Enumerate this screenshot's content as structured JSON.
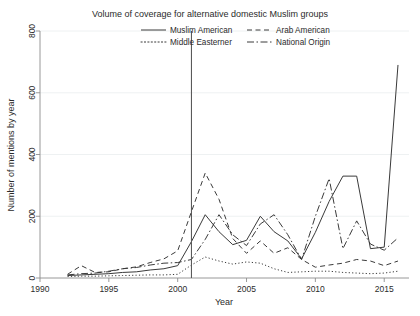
{
  "chart_data": {
    "type": "line",
    "title": "Volume of coverage for alternative domestic Muslim groups",
    "xlabel": "Year",
    "ylabel": "Number of mentions by year",
    "xlim": [
      1990,
      2016.8
    ],
    "ylim": [
      0,
      800
    ],
    "grid": "horizontal",
    "legend_position": "top-center",
    "x_ticks": [
      1990,
      1995,
      2000,
      2005,
      2010,
      2015
    ],
    "x_tick_labels": [
      "1990",
      "1995",
      "2000",
      "2005",
      "2010",
      "2015"
    ],
    "y_ticks": [
      0,
      200,
      400,
      600,
      800
    ],
    "y_tick_labels": [
      "0",
      "200",
      "400",
      "600",
      "800"
    ],
    "annotations": [
      {
        "type": "vline",
        "x": 2001,
        "label": ""
      }
    ],
    "x": [
      1992,
      1993,
      1994,
      1995,
      1996,
      1997,
      1998,
      1999,
      2000,
      2001,
      2002,
      2003,
      2004,
      2005,
      2006,
      2007,
      2008,
      2009,
      2010,
      2011,
      2012,
      2013,
      2014,
      2015,
      2016
    ],
    "series": [
      {
        "name": "Muslim American",
        "style": "solid",
        "values": [
          8,
          10,
          12,
          14,
          18,
          20,
          26,
          30,
          40,
          118,
          205,
          150,
          108,
          122,
          200,
          150,
          120,
          62,
          148,
          248,
          330,
          330,
          95,
          100,
          690
        ]
      },
      {
        "name": "Arab American",
        "style": "dashed",
        "values": [
          12,
          40,
          18,
          20,
          30,
          36,
          50,
          62,
          88,
          215,
          340,
          255,
          128,
          80,
          120,
          80,
          98,
          60,
          35,
          42,
          48,
          60,
          55,
          40,
          55
        ]
      },
      {
        "name": "Middle Easterner",
        "style": "dotted",
        "values": [
          5,
          6,
          6,
          7,
          8,
          9,
          10,
          10,
          12,
          42,
          68,
          55,
          45,
          52,
          48,
          30,
          18,
          20,
          22,
          22,
          18,
          16,
          14,
          16,
          22
        ]
      },
      {
        "name": "National Origin",
        "style": "dashdot",
        "values": [
          10,
          14,
          16,
          22,
          30,
          34,
          42,
          48,
          50,
          60,
          125,
          205,
          140,
          105,
          175,
          205,
          140,
          60,
          200,
          322,
          95,
          185,
          110,
          90,
          130
        ]
      }
    ]
  },
  "legend": {
    "items": [
      {
        "label": "Muslim American",
        "style": "solid"
      },
      {
        "label": "Arab American",
        "style": "dashed"
      },
      {
        "label": "Middle Easterner",
        "style": "dotted"
      },
      {
        "label": "National Origin",
        "style": "dashdot"
      }
    ]
  }
}
